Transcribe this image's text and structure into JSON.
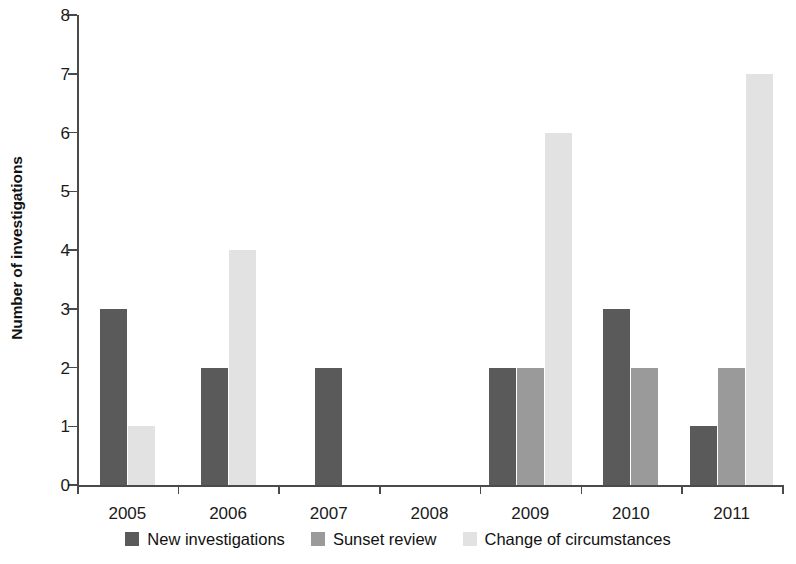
{
  "chart_data": {
    "type": "bar",
    "title": "",
    "subtitle": "",
    "xlabel": "",
    "ylabel": "Number of investigations",
    "categories": [
      "2005",
      "2006",
      "2007",
      "2008",
      "2009",
      "2010",
      "2011"
    ],
    "series": [
      {
        "name": "New investigations",
        "color": "#5a5a5a",
        "values": [
          3,
          2,
          2,
          0,
          2,
          3,
          1
        ]
      },
      {
        "name": "Sunset review",
        "color": "#9a9a9a",
        "values": [
          0,
          0,
          0,
          0,
          2,
          2,
          2
        ]
      },
      {
        "name": "Change of circumstances",
        "color": "#e2e2e2",
        "values": [
          1,
          4,
          0,
          0,
          6,
          0,
          7
        ]
      }
    ],
    "ylim": [
      0,
      8
    ],
    "ytick_labels": [
      "0",
      "1",
      "2",
      "3",
      "4",
      "5",
      "6",
      "7",
      "8"
    ],
    "ytick_values": [
      0,
      1,
      2,
      3,
      4,
      5,
      6,
      7,
      8
    ],
    "ytick_interval": 1,
    "grid": false,
    "legend_position": "bottom",
    "zero_bars_hidden": true,
    "bar_pack": "left",
    "axis_color": "#4a4a4a",
    "background_color": "#ffffff"
  },
  "legend": {
    "items": [
      {
        "label": "New investigations",
        "color": "#5a5a5a"
      },
      {
        "label": "Sunset review",
        "color": "#9a9a9a"
      },
      {
        "label": "Change of circumstances",
        "color": "#e2e2e2"
      }
    ]
  },
  "axes": {
    "y_title": "Number of investigations"
  }
}
